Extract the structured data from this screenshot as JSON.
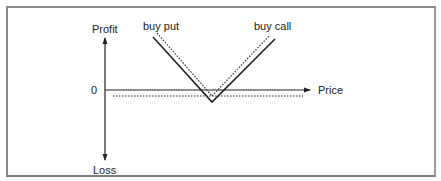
{
  "diagram": {
    "title": "",
    "axes": {
      "y_positive_label": "Profit",
      "y_negative_label": "Loss",
      "x_label": "Price",
      "origin_label": "0"
    },
    "series": [
      {
        "name": "buy put",
        "style": "dotted",
        "description": "long put payoff",
        "shape": "down-sloping to strike then flat"
      },
      {
        "name": "buy call",
        "style": "dotted",
        "description": "long call payoff",
        "shape": "flat then up-sloping from strike"
      },
      {
        "name": "straddle",
        "style": "solid",
        "description": "combined payoff (buy put + buy call)",
        "shape": "V"
      }
    ],
    "labels": {
      "put": "buy put",
      "call": "buy call"
    },
    "colors": {
      "line": "#222222",
      "frame": "#8a8a8a"
    }
  }
}
